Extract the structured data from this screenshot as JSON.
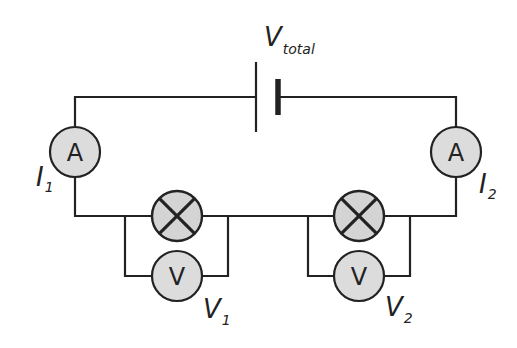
{
  "diagram": {
    "colors": {
      "wire": "#222222",
      "component_fill": "#dcdcdc",
      "lamp_fill": "#d4d4d4",
      "background": "#ffffff"
    },
    "battery": {
      "label_main": "V",
      "label_sub": "total"
    },
    "ammeters": [
      {
        "symbol": "A",
        "label_main": "I",
        "label_sub": "1"
      },
      {
        "symbol": "A",
        "label_main": "I",
        "label_sub": "2"
      }
    ],
    "lamps": [
      {
        "id": "lamp-1"
      },
      {
        "id": "lamp-2"
      }
    ],
    "voltmeters": [
      {
        "symbol": "V",
        "label_main": "V",
        "label_sub": "1"
      },
      {
        "symbol": "V",
        "label_main": "V",
        "label_sub": "2"
      }
    ]
  }
}
